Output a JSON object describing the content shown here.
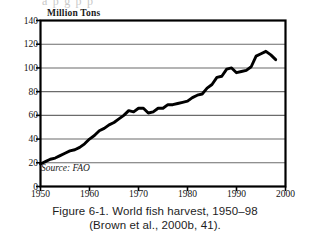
{
  "page": {
    "bleed_text_top": "a p       g           p  p",
    "caption_line1": "Figure 6-1. World fish harvest, 1950–98",
    "caption_line2": "(Brown et al., 2000b, 41)."
  },
  "colors": {
    "ink": "#111111",
    "frame": "#000000",
    "gridline": "#6b6b6b",
    "curve": "#000000",
    "paper": "#ffffff"
  },
  "chart_data": {
    "type": "line",
    "title": "",
    "subtitle": "",
    "ylabel": "Million Tons",
    "xlabel": "",
    "source_note": "Source: FAO",
    "xlim": [
      1950,
      2000
    ],
    "ylim": [
      0,
      140
    ],
    "xticks": [
      1950,
      1960,
      1970,
      1980,
      1990,
      2000
    ],
    "xtick_labels": [
      "1950",
      "1960",
      "1970",
      "1980",
      "1990",
      "2000"
    ],
    "yticks": [
      0,
      20,
      40,
      60,
      80,
      100,
      120,
      140
    ],
    "ytick_labels": [
      "0",
      "20",
      "40",
      "60",
      "80",
      "100",
      "120",
      "140"
    ],
    "grid": "horizontal",
    "legend": "none",
    "series": [
      {
        "name": "World fish harvest",
        "units": "million tons",
        "x": [
          1950,
          1951,
          1952,
          1953,
          1954,
          1955,
          1956,
          1957,
          1958,
          1959,
          1960,
          1961,
          1962,
          1963,
          1964,
          1965,
          1966,
          1967,
          1968,
          1969,
          1970,
          1971,
          1972,
          1973,
          1974,
          1975,
          1976,
          1977,
          1978,
          1979,
          1980,
          1981,
          1982,
          1983,
          1984,
          1985,
          1986,
          1987,
          1988,
          1989,
          1990,
          1991,
          1992,
          1993,
          1994,
          1995,
          1996,
          1997,
          1998
        ],
        "values": [
          19,
          21,
          23,
          24,
          26,
          28,
          30,
          31,
          33,
          36,
          40,
          43,
          47,
          49,
          52,
          54,
          57,
          60,
          64,
          63,
          66,
          66,
          62,
          63,
          66,
          66,
          69,
          69,
          70,
          71,
          72,
          75,
          77,
          78,
          83,
          86,
          92,
          93,
          99,
          100,
          96,
          97,
          98,
          101,
          110,
          112,
          114,
          111,
          107
        ]
      }
    ]
  }
}
